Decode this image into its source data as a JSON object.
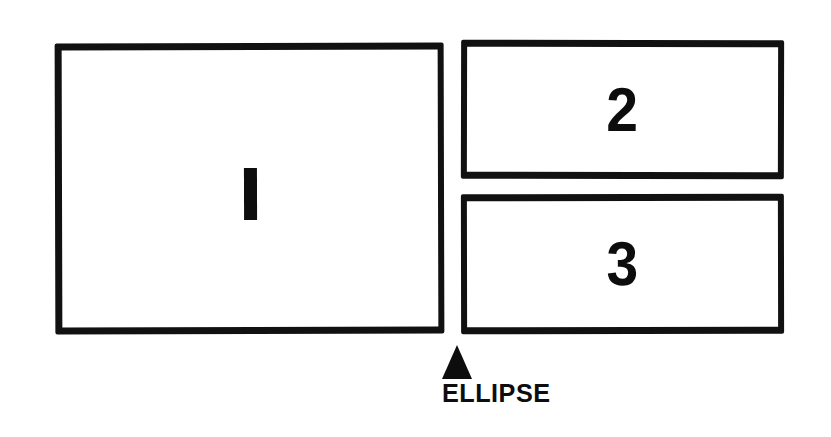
{
  "figure": {
    "background_color": "#ffffff",
    "ink_color": "#0d0d0d",
    "panels": [
      {
        "label": "1",
        "name": "panel-1",
        "position": "left-large"
      },
      {
        "label": "2",
        "name": "panel-2",
        "position": "top-right"
      },
      {
        "label": "3",
        "name": "panel-3",
        "position": "bottom-right"
      }
    ],
    "callout": {
      "marker": "up-triangle",
      "caption": "ELLIPSE"
    }
  }
}
